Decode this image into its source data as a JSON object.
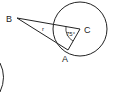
{
  "diagram": {
    "points": {
      "B": {
        "label": "B",
        "x": 17,
        "y": 18
      },
      "C": {
        "label": "C",
        "x": 80,
        "y": 29
      },
      "A": {
        "label": "A",
        "x": 68,
        "y": 50
      }
    },
    "circle": {
      "cx": 80,
      "cy": 29,
      "r": 27
    },
    "angle_label": "r",
    "angle_C_label": "75°",
    "stroke_color": "#222222"
  }
}
